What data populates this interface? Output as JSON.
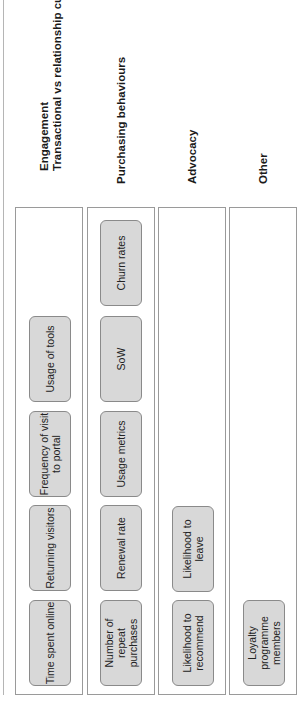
{
  "columns": [
    {
      "heading_line1": "Engagement",
      "heading_line2": "Transactional vs relationship customer",
      "items": [
        "Time spent online",
        "Returning visitors",
        "Frequency of visit to portal",
        "Usage of tools"
      ]
    },
    {
      "heading_line1": "Purchasing behaviours",
      "items": [
        "Number of repeat purchases",
        "Renewal rate",
        "Usage metrics",
        "SoW",
        "Churn rates"
      ]
    },
    {
      "heading_line1": "Advocacy",
      "items": [
        "Likelihood to recommend",
        "Likelihood to leave"
      ]
    },
    {
      "heading_line1": "Other",
      "items": [
        "Loyalty programme members"
      ]
    }
  ],
  "colors": {
    "box_fill": "#d8d8d8",
    "box_border": "#8a8a8a",
    "panel_border": "#9a9a9a"
  }
}
